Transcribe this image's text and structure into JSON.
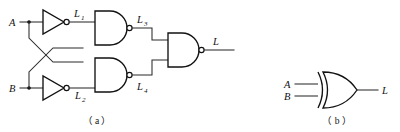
{
  "figure": {
    "background_color": "#ffffff",
    "line_color": "#2b2b2b",
    "gate_stroke_color": "#111111",
    "text_color": "#111111"
  },
  "panel_a": {
    "caption": "（ a ）",
    "caption_plain": "(a)",
    "inputs": [
      {
        "name": "input-a",
        "label": "A"
      },
      {
        "name": "input-b",
        "label": "B"
      }
    ],
    "nodes": [
      {
        "name": "node-l1",
        "label": "L",
        "subscript": "1"
      },
      {
        "name": "node-l2",
        "label": "L",
        "subscript": "2"
      },
      {
        "name": "node-l3",
        "label": "L",
        "subscript": "3"
      },
      {
        "name": "node-l4",
        "label": "L",
        "subscript": "4"
      }
    ],
    "output": {
      "name": "output-l",
      "label": "L"
    },
    "gates": [
      {
        "name": "inverter-a",
        "type": "NOT",
        "inputs": [
          "A"
        ],
        "output": "L1"
      },
      {
        "name": "inverter-b",
        "type": "NOT",
        "inputs": [
          "B"
        ],
        "output": "L2"
      },
      {
        "name": "nand-top",
        "type": "NAND",
        "inputs": [
          "L1",
          "B"
        ],
        "output": "L3"
      },
      {
        "name": "nand-bottom",
        "type": "NAND",
        "inputs": [
          "A",
          "L2"
        ],
        "output": "L4"
      },
      {
        "name": "nand-output",
        "type": "NAND",
        "inputs": [
          "L3",
          "L4"
        ],
        "output": "L"
      }
    ]
  },
  "panel_b": {
    "caption": "（ b ）",
    "caption_plain": "(b)",
    "inputs": [
      {
        "name": "input-a",
        "label": "A"
      },
      {
        "name": "input-b",
        "label": "B"
      }
    ],
    "output": {
      "name": "output-l",
      "label": "L"
    },
    "gates": [
      {
        "name": "xor-gate",
        "type": "XOR",
        "inputs": [
          "A",
          "B"
        ],
        "output": "L"
      }
    ]
  }
}
